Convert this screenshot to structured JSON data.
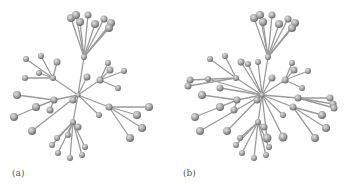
{
  "figure": {
    "panels": [
      {
        "id": "a",
        "label": "(a)",
        "nodes": [
          [
            78,
            95,
            2.5
          ],
          [
            84,
            57,
            3
          ],
          [
            73,
            100,
            3.5
          ],
          [
            87,
            77,
            3.5
          ],
          [
            71,
            18,
            4
          ],
          [
            76,
            15,
            4
          ],
          [
            88,
            15,
            3.5
          ],
          [
            80,
            22,
            4
          ],
          [
            95,
            24,
            4
          ],
          [
            104,
            19,
            3.5
          ],
          [
            111,
            23,
            4
          ],
          [
            109,
            28,
            4
          ],
          [
            53,
            78,
            3
          ],
          [
            26,
            59,
            3
          ],
          [
            41,
            56,
            3
          ],
          [
            25,
            78,
            3
          ],
          [
            39,
            73,
            3
          ],
          [
            57,
            62,
            3.5
          ],
          [
            54,
            100,
            3.5
          ],
          [
            17,
            95,
            4
          ],
          [
            14,
            117,
            4
          ],
          [
            36,
            107,
            4
          ],
          [
            50,
            110,
            3.5
          ],
          [
            32,
            131,
            4
          ],
          [
            100,
            80,
            3.5
          ],
          [
            108,
            63,
            3
          ],
          [
            110,
            70,
            3.5
          ],
          [
            124,
            71,
            3
          ],
          [
            118,
            88,
            3
          ],
          [
            109,
            107,
            3.5
          ],
          [
            149,
            107,
            4
          ],
          [
            137,
            115,
            4
          ],
          [
            142,
            128,
            4
          ],
          [
            130,
            138,
            4
          ],
          [
            99,
            115,
            3
          ],
          [
            73,
            122,
            3
          ],
          [
            78,
            127,
            3.5
          ],
          [
            57,
            138,
            3
          ],
          [
            52,
            145,
            3
          ],
          [
            58,
            153,
            3
          ],
          [
            70,
            158,
            3
          ],
          [
            82,
            155,
            3
          ],
          [
            85,
            147,
            3
          ],
          [
            68,
            135,
            3
          ]
        ],
        "edges": [
          [
            0,
            1
          ],
          [
            1,
            4
          ],
          [
            1,
            5
          ],
          [
            1,
            6
          ],
          [
            1,
            7
          ],
          [
            1,
            8
          ],
          [
            1,
            9
          ],
          [
            1,
            10
          ],
          [
            1,
            11
          ],
          [
            0,
            2
          ],
          [
            0,
            3
          ],
          [
            0,
            12
          ],
          [
            12,
            13
          ],
          [
            12,
            14
          ],
          [
            12,
            15
          ],
          [
            12,
            16
          ],
          [
            12,
            17
          ],
          [
            0,
            18
          ],
          [
            18,
            19
          ],
          [
            18,
            20
          ],
          [
            18,
            21
          ],
          [
            18,
            22
          ],
          [
            0,
            23
          ],
          [
            0,
            24
          ],
          [
            24,
            25
          ],
          [
            24,
            26
          ],
          [
            24,
            27
          ],
          [
            24,
            28
          ],
          [
            0,
            29
          ],
          [
            29,
            30
          ],
          [
            29,
            31
          ],
          [
            29,
            32
          ],
          [
            29,
            33
          ],
          [
            0,
            34
          ],
          [
            0,
            35
          ],
          [
            35,
            36
          ],
          [
            35,
            37
          ],
          [
            35,
            38
          ],
          [
            35,
            39
          ],
          [
            35,
            40
          ],
          [
            35,
            41
          ],
          [
            35,
            42
          ],
          [
            35,
            43
          ]
        ]
      },
      {
        "id": "b",
        "label": "(b)",
        "nodes": [
          [
            262,
            95,
            2.5
          ],
          [
            268,
            57,
            3
          ],
          [
            257,
            100,
            3.5
          ],
          [
            272,
            78,
            3.5
          ],
          [
            254,
            18,
            4
          ],
          [
            260,
            15,
            4
          ],
          [
            272,
            15,
            3.5
          ],
          [
            263,
            22,
            4
          ],
          [
            279,
            24,
            4
          ],
          [
            288,
            19,
            3.5
          ],
          [
            295,
            23,
            4
          ],
          [
            292,
            28,
            4
          ],
          [
            236,
            78,
            3
          ],
          [
            210,
            59,
            3
          ],
          [
            225,
            56,
            3
          ],
          [
            190,
            80,
            3.5
          ],
          [
            188,
            86,
            3.5
          ],
          [
            208,
            79,
            3
          ],
          [
            241,
            62,
            3.5
          ],
          [
            248,
            64,
            3
          ],
          [
            258,
            62,
            3
          ],
          [
            237,
            100,
            3.5
          ],
          [
            202,
            95,
            4
          ],
          [
            195,
            117,
            4
          ],
          [
            220,
            107,
            4
          ],
          [
            234,
            110,
            3.5
          ],
          [
            220,
            88,
            3.5
          ],
          [
            200,
            131,
            4
          ],
          [
            285,
            80,
            3.5
          ],
          [
            292,
            63,
            3
          ],
          [
            294,
            70,
            3.5
          ],
          [
            308,
            71,
            3
          ],
          [
            302,
            88,
            3
          ],
          [
            298,
            98,
            3.5
          ],
          [
            330,
            98,
            3.5
          ],
          [
            333,
            104,
            3.5
          ],
          [
            334,
            108,
            3.5
          ],
          [
            293,
            107,
            3.5
          ],
          [
            322,
            115,
            4
          ],
          [
            326,
            128,
            4
          ],
          [
            315,
            138,
            4
          ],
          [
            283,
            115,
            3
          ],
          [
            258,
            122,
            3
          ],
          [
            264,
            127,
            3.5
          ],
          [
            240,
            138,
            3
          ],
          [
            236,
            145,
            3
          ],
          [
            242,
            153,
            3
          ],
          [
            254,
            158,
            3
          ],
          [
            266,
            155,
            3
          ],
          [
            269,
            147,
            3
          ],
          [
            267,
            138,
            4.5
          ],
          [
            283,
            137,
            4.5
          ],
          [
            227,
            131,
            4
          ]
        ],
        "edges": [
          [
            0,
            1
          ],
          [
            1,
            4
          ],
          [
            1,
            5
          ],
          [
            1,
            6
          ],
          [
            1,
            7
          ],
          [
            1,
            8
          ],
          [
            1,
            9
          ],
          [
            1,
            10
          ],
          [
            1,
            11
          ],
          [
            0,
            2
          ],
          [
            0,
            3
          ],
          [
            0,
            12
          ],
          [
            12,
            13
          ],
          [
            12,
            14
          ],
          [
            12,
            15
          ],
          [
            12,
            16
          ],
          [
            0,
            17
          ],
          [
            0,
            18
          ],
          [
            0,
            19
          ],
          [
            0,
            20
          ],
          [
            0,
            21
          ],
          [
            21,
            22
          ],
          [
            21,
            23
          ],
          [
            21,
            24
          ],
          [
            21,
            25
          ],
          [
            0,
            26
          ],
          [
            0,
            27
          ],
          [
            0,
            28
          ],
          [
            28,
            29
          ],
          [
            28,
            30
          ],
          [
            28,
            31
          ],
          [
            28,
            32
          ],
          [
            0,
            33
          ],
          [
            33,
            34
          ],
          [
            33,
            35
          ],
          [
            33,
            36
          ],
          [
            0,
            37
          ],
          [
            37,
            38
          ],
          [
            37,
            39
          ],
          [
            37,
            40
          ],
          [
            0,
            41
          ],
          [
            0,
            42
          ],
          [
            42,
            43
          ],
          [
            42,
            44
          ],
          [
            42,
            45
          ],
          [
            42,
            46
          ],
          [
            42,
            47
          ],
          [
            42,
            48
          ],
          [
            42,
            49
          ],
          [
            0,
            50
          ],
          [
            0,
            51
          ],
          [
            0,
            52
          ]
        ]
      }
    ],
    "colors": {
      "edge": "#9a9a9a",
      "edge_dark": "#5a5a5a",
      "node_light": "#d4d4d4",
      "node_mid": "#a6a6a6",
      "node_dark": "#6e6e6e",
      "background": "#ffffff",
      "label": "#555555"
    }
  }
}
